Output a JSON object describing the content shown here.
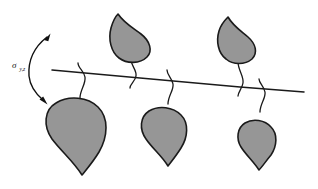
{
  "figure": {
    "background_color": "#ffffff",
    "width": 318,
    "height": 189
  },
  "colors": {
    "leaf_fill": "#969696",
    "outline": "#1a1a1a",
    "background": "#ffffff",
    "label": "#111111"
  },
  "annotation": {
    "label_symbol": "σ",
    "label_subscript": "y,z",
    "label_full": "σy,z",
    "arrow_type": "double-headed-curved-arrow",
    "arrow_meaning": "rotation-about-branch-axis",
    "upper_arrow_direction": "up-right",
    "lower_arrow_direction": "down-right"
  },
  "branch": {
    "name": "main-branch-axis",
    "start_x": 52,
    "start_y": 70,
    "end_x": 304,
    "end_y": 92,
    "slope": "gently-downward-to-the-right"
  },
  "leaves": [
    {
      "id": "upper-leaf-1",
      "position": "above-branch",
      "orientation": "tip-up",
      "center_x": 131,
      "center_y": 38,
      "size": "medium",
      "stem_attach_x": 134,
      "stem_attach_y": 78
    },
    {
      "id": "upper-leaf-2",
      "position": "above-branch",
      "orientation": "tip-up",
      "center_x": 238,
      "center_y": 40,
      "size": "medium",
      "stem_attach_x": 242,
      "stem_attach_y": 86
    },
    {
      "id": "lower-leaf-1",
      "position": "below-branch",
      "orientation": "tip-down",
      "center_x": 79,
      "center_y": 130,
      "size": "large",
      "stem_attach_x": 85,
      "stem_attach_y": 73
    },
    {
      "id": "lower-leaf-2",
      "position": "below-branch",
      "orientation": "tip-down",
      "center_x": 167,
      "center_y": 133,
      "size": "medium",
      "stem_attach_x": 173,
      "stem_attach_y": 80
    },
    {
      "id": "lower-leaf-3",
      "position": "below-branch",
      "orientation": "tip-down",
      "center_x": 259,
      "center_y": 139,
      "size": "small",
      "stem_attach_x": 265,
      "stem_attach_y": 88
    }
  ],
  "counts": {
    "total_leaves": 5,
    "upper_leaves": 2,
    "lower_leaves": 3
  }
}
